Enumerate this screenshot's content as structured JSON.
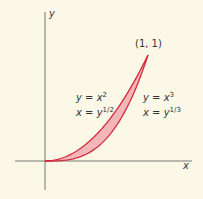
{
  "axes": {
    "x_label": "x",
    "y_label": "y"
  },
  "point_label": "(1, 1)",
  "curve_left": {
    "eq1_lhs": "y",
    "eq1_rhs": "x",
    "eq1_exp": "2",
    "eq2_lhs": "x",
    "eq2_rhs": "y",
    "eq2_exp": "1/2"
  },
  "curve_right": {
    "eq1_lhs": "y",
    "eq1_rhs": "x",
    "eq1_exp": "3",
    "eq2_lhs": "x",
    "eq2_rhs": "y",
    "eq2_exp": "1/3"
  },
  "colors": {
    "curve": "#d42a3a",
    "fill": "#f4b7b9",
    "axis": "#555555",
    "background": "#fbf8e8"
  },
  "chart_data": {
    "type": "area",
    "xlabel": "x",
    "ylabel": "y",
    "series": [
      {
        "name": "y = x^2 (x = y^(1/2))",
        "x": [
          0,
          0.25,
          0.5,
          0.75,
          1
        ],
        "values": [
          0,
          0.0625,
          0.25,
          0.5625,
          1
        ]
      },
      {
        "name": "y = x^3 (x = y^(1/3))",
        "x": [
          0,
          0.25,
          0.5,
          0.75,
          1
        ],
        "values": [
          0,
          0.0156,
          0.125,
          0.4219,
          1
        ]
      }
    ],
    "annotations": [
      "(1, 1)"
    ],
    "grid": false
  }
}
